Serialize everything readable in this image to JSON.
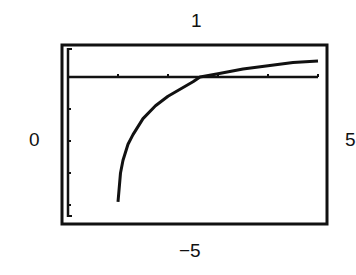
{
  "window": {
    "ymax_label": "1",
    "ymin_label": "−5",
    "xmin_label": "0",
    "xmax_label": "5"
  },
  "chart_data": {
    "type": "line",
    "title": "",
    "xlabel": "",
    "ylabel": "",
    "xlim": [
      0,
      5
    ],
    "ylim": [
      -5,
      1
    ],
    "grid": false,
    "x_ticks": [
      1,
      2,
      3,
      4,
      5
    ],
    "y_ticks": [
      -1,
      -2,
      -3,
      -4
    ],
    "series": [
      {
        "name": "curve",
        "x": [
          1.0,
          1.05,
          1.1,
          1.2,
          1.3,
          1.5,
          1.75,
          2.0,
          2.5,
          2.64,
          3.0,
          3.5,
          4.0,
          4.5,
          5.0
        ],
        "y": [
          -3.9,
          -3.0,
          -2.6,
          -2.1,
          -1.8,
          -1.3,
          -0.9,
          -0.6,
          -0.15,
          0.0,
          0.1,
          0.25,
          0.35,
          0.45,
          0.5
        ]
      }
    ]
  }
}
